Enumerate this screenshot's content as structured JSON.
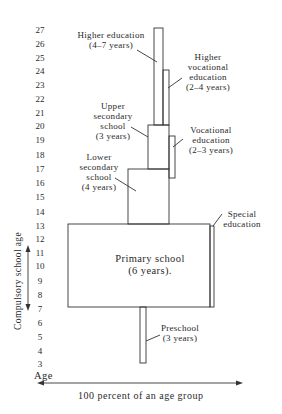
{
  "y_axis": {
    "ticks": [
      "27",
      "26",
      "25",
      "24",
      "23",
      "22",
      "21",
      "20",
      "19",
      "18",
      "17",
      "16",
      "15",
      "14",
      "13",
      "12",
      "11",
      "10",
      "9",
      "8",
      "7",
      "6",
      "5",
      "4",
      "3"
    ],
    "label": "Age",
    "compulsory_label": "Compulsory school age"
  },
  "x_axis": {
    "label": "100 percent of an age group"
  },
  "blocks": {
    "higher_education": {
      "line1": "Higher education",
      "line2": "(4–7 years)"
    },
    "higher_vocational": {
      "line1": "Higher",
      "line2": "vocational",
      "line3": "education",
      "line4": "(2–4 years)"
    },
    "upper_secondary": {
      "line1": "Upper",
      "line2": "secondary",
      "line3": "school",
      "line4": "(3 years)"
    },
    "vocational": {
      "line1": "Vocational",
      "line2": "education",
      "line3": "(2–3 years)"
    },
    "lower_secondary": {
      "line1": "Lower",
      "line2": "secondary",
      "line3": "school",
      "line4": "(4 years)"
    },
    "primary": {
      "line1": "Primary school",
      "line2": "(6 years)."
    },
    "special": {
      "line1": "Special",
      "line2": "education"
    },
    "preschool": {
      "line1": "Preschool",
      "line2": "(3 years)"
    }
  },
  "colors": {
    "line": "#333333",
    "background": "#ffffff"
  }
}
